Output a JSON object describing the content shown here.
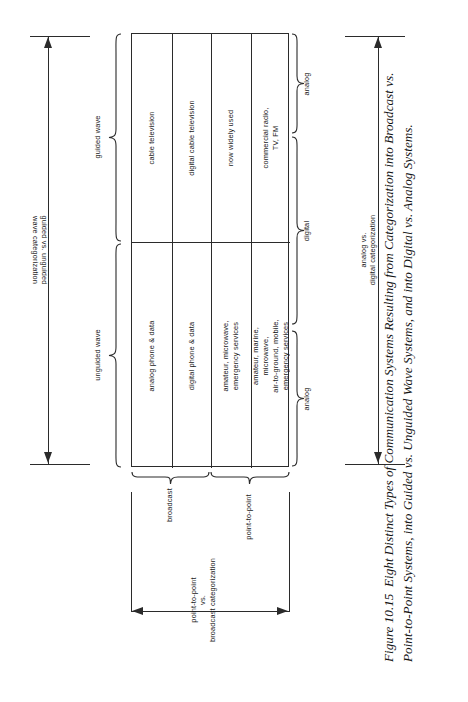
{
  "figure": {
    "number": "Figure 10.15",
    "caption": "Eight Distinct Types of Communication Systems Resulting from Categorization into Broadcast vs. Point-to-Point Systems, into Guided vs. Unguided Wave Systems, and into Digital vs. Analog Systems."
  },
  "matrix": {
    "rows": [
      {
        "name": "broadcast",
        "cells": [
          "commercial radio,\nTV, FM",
          "now widely used",
          "digital cable television",
          "cable television"
        ]
      },
      {
        "name": "point-to-point",
        "cells": [
          "amateur, marine,\nmicrowave,\nair-to-ground, mobile,\nemergency services",
          "amateur, microwave,\nemergency services",
          "digital phone & data",
          "analog phone & data"
        ]
      }
    ]
  },
  "left_axis": {
    "arrow_label": "guided vs. unguided\nwave categorization",
    "braces": [
      {
        "label": "unguided wave"
      },
      {
        "label": "guided wave"
      }
    ]
  },
  "right_axis": {
    "arrow_label": "analog vs.\ndigital categorization",
    "braces": [
      {
        "label": "analog"
      },
      {
        "label": "digital"
      },
      {
        "label": "analog"
      }
    ]
  },
  "bottom_axis": {
    "arrow_label": "point-to-point\nvs.\nbroadcast categorization",
    "braces": [
      {
        "label": "broadcast"
      },
      {
        "label": "point-to-point"
      }
    ]
  },
  "colors": {
    "ink": "#2b2b2b",
    "paper": "#ffffff"
  }
}
